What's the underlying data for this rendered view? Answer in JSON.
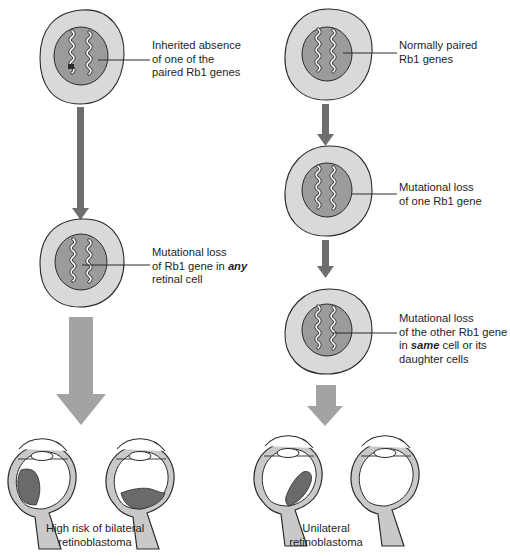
{
  "colors": {
    "cell_fill": "#d9d9d9",
    "nucleus_fill": "#9b9b9b",
    "outline": "#2b2b2b",
    "arrow_dark": "#6e6e6e",
    "arrow_light": "#a3a3a3",
    "tumor": "#6a6a6a",
    "optic_nerve": "#c9c9c9"
  },
  "left_path": {
    "step1_label": [
      "Inherited absence",
      "of one of the",
      "paired Rb1 genes"
    ],
    "step2_label_line1": "Mutational loss",
    "step2_label_line2_pre": "of Rb1 gene in ",
    "step2_label_line2_em": "any",
    "step2_label_line3": "retinal cell",
    "outcome_caption": [
      "High risk of bilateral",
      "retinoblastoma"
    ]
  },
  "right_path": {
    "step1_label": [
      "Normally paired",
      "Rb1 genes"
    ],
    "step2_label": [
      "Mutational loss",
      "of one Rb1 gene"
    ],
    "step3_label_line1": "Mutational loss",
    "step3_label_line2": "of the other Rb1 gene",
    "step3_label_line3_pre": "in ",
    "step3_label_line3_em": "same",
    "step3_label_line3_post": " cell or its",
    "step3_label_line4": "daughter cells",
    "outcome_caption": [
      "Unilateral",
      "retinoblastoma"
    ]
  }
}
